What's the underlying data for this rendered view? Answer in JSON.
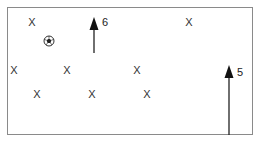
{
  "diagram": {
    "field": {
      "border_color": "#8a8a8a"
    },
    "players": [
      {
        "label": "X",
        "x": 32,
        "y": 22
      },
      {
        "label": "X",
        "x": 189,
        "y": 22
      },
      {
        "label": "X",
        "x": 14,
        "y": 70
      },
      {
        "label": "X",
        "x": 67,
        "y": 70
      },
      {
        "label": "X",
        "x": 137,
        "y": 70
      },
      {
        "label": "X",
        "x": 37,
        "y": 94
      },
      {
        "label": "X",
        "x": 92,
        "y": 94
      },
      {
        "label": "X",
        "x": 147,
        "y": 94
      }
    ],
    "ball": {
      "icon": "soccer-ball-icon",
      "x": 49,
      "y": 41
    },
    "arrows": [
      {
        "label": "6",
        "x": 94,
        "y_tip": 17,
        "y_tail": 53
      },
      {
        "label": "5",
        "x": 229,
        "y_tip": 65,
        "y_tail": 135
      }
    ]
  }
}
